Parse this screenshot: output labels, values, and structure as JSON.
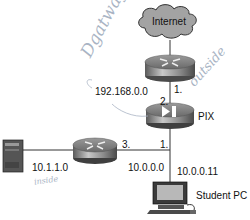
{
  "diagram": {
    "nodes": {
      "internet": {
        "label": "Internet",
        "type": "cloud"
      },
      "edge_router": {
        "type": "router"
      },
      "pix": {
        "label": "PIX",
        "type": "firewall"
      },
      "inside_router": {
        "type": "router"
      },
      "server": {
        "type": "server"
      },
      "student_pc": {
        "label": "Student PC",
        "type": "workstation"
      }
    },
    "links": {
      "gateway_net": "192.168.0.0",
      "inside_net": "10.1.1.0",
      "lan_net": "10.0.0.0",
      "pc_ip": "10.0.0.11"
    },
    "interface_labels": {
      "edge_router_if": "1.",
      "pix_outside_if": "2.",
      "pix_inside_if": "1.",
      "inside_router_if": "3."
    },
    "handwritten": {
      "gateway": "Dgatway",
      "outside": "outside",
      "inside": "inside"
    },
    "colors": {
      "device_gray": "#8a8a8a",
      "cloud_gray": "#a3a3a3",
      "pen_blue": "#a9b4c4",
      "line": "#333333"
    }
  }
}
